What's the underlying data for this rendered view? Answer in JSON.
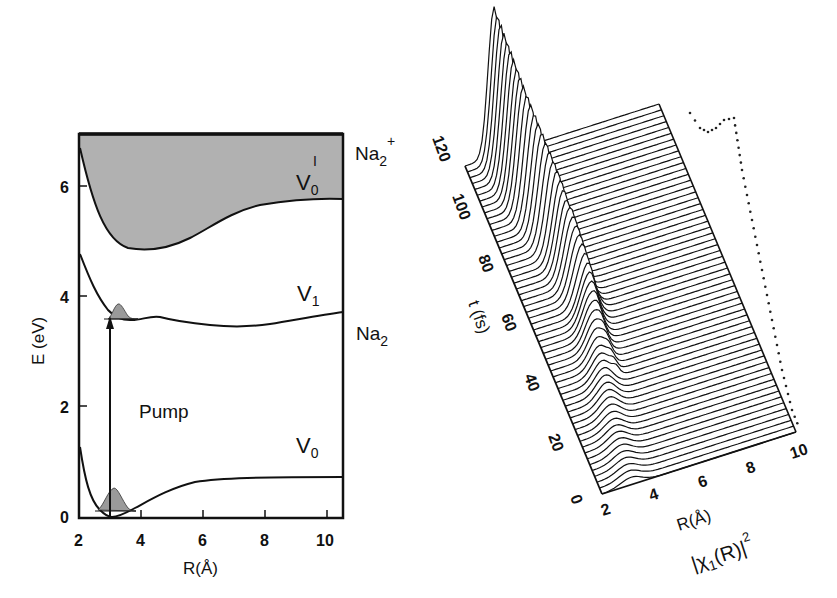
{
  "chart_data": [
    {
      "type": "line",
      "title": "",
      "xlabel": "R(Å)",
      "ylabel": "E (eV)",
      "xlim": [
        2,
        10.5
      ],
      "ylim": [
        0,
        7
      ],
      "x_ticks": [
        "2",
        "4",
        "6",
        "8",
        "10"
      ],
      "y_ticks": [
        "0",
        "2",
        "4",
        "6"
      ],
      "grid": false,
      "series": [
        {
          "name": "V0",
          "label": "V₀",
          "molecule": "Na2",
          "x": [
            2.0,
            2.3,
            2.6,
            3.0,
            3.3,
            3.6,
            4.0,
            5.0,
            6.0,
            7.0,
            8.0,
            10.5
          ],
          "y": [
            1.4,
            0.6,
            0.15,
            0.0,
            0.03,
            0.12,
            0.3,
            0.58,
            0.68,
            0.71,
            0.72,
            0.72
          ]
        },
        {
          "name": "V1",
          "label": "V₁",
          "molecule": "Na2",
          "x": [
            2.0,
            2.3,
            2.6,
            3.0,
            3.4,
            3.8,
            4.6,
            5.5,
            6.5,
            7.5,
            8.5,
            10.5
          ],
          "y": [
            4.9,
            4.3,
            3.9,
            3.65,
            3.58,
            3.56,
            3.63,
            3.5,
            3.45,
            3.46,
            3.55,
            3.72
          ]
        },
        {
          "name": "V0'",
          "label": "V₀'",
          "molecule": "Na2+",
          "shaded": true,
          "x": [
            2.0,
            2.3,
            2.7,
            3.2,
            3.8,
            4.5,
            5.5,
            6.5,
            7.5,
            8.5,
            10.5
          ],
          "y": [
            6.7,
            6.0,
            5.4,
            5.0,
            4.88,
            5.0,
            5.35,
            5.6,
            5.73,
            5.77,
            5.78
          ]
        }
      ],
      "annotations": [
        {
          "text": "Pump",
          "type": "vertical arrow",
          "x": 3.0,
          "from_y": 0.0,
          "to_y": 3.65
        },
        {
          "text": "Na₂⁺",
          "at": "right of V0' curve"
        },
        {
          "text": "Na₂",
          "at": "right of V1 curve"
        },
        {
          "text": "ground-state wavepacket",
          "x_center": 3.1,
          "on": "V0"
        },
        {
          "text": "excited wavepacket",
          "x_center": 3.2,
          "on": "V1"
        }
      ]
    },
    {
      "type": "area",
      "subtype": "3d waterfall",
      "title": "",
      "xlabel": "R(Å)",
      "ylabel": "t (fs)",
      "zlabel": "|χ₁(R)|²",
      "xlim": [
        2,
        10
      ],
      "ylim": [
        0,
        120
      ],
      "x_ticks": [
        "2",
        "4",
        "6",
        "8",
        "10"
      ],
      "y_ticks": [
        "0",
        "20",
        "40",
        "60",
        "80",
        "100",
        "120"
      ],
      "grid": false,
      "description": "Wavepacket probability density on V1 vs R and t; peak near R≈3.2 Å at t=0 grows and moves, reaching maximum amplitude near t≈120 fs at small R; dotted curve shows projection at final time",
      "series": [
        {
          "name": "peak_R_vs_t",
          "t": [
            0,
            20,
            40,
            60,
            80,
            100,
            120
          ],
          "R": [
            3.2,
            3.4,
            3.8,
            4.2,
            4.0,
            3.5,
            3.2
          ],
          "relative_amplitude": [
            0.05,
            0.08,
            0.15,
            0.3,
            0.55,
            0.8,
            1.0
          ]
        }
      ]
    }
  ],
  "left_plot": {
    "ylabel": "E (eV)",
    "xlabel": "R(Å)",
    "y_ticks": [
      "0",
      "2",
      "4",
      "6"
    ],
    "x_ticks": [
      "2",
      "4",
      "6",
      "8",
      "10"
    ],
    "labels": {
      "v0_prime": "V",
      "v0_prime_sub": "0",
      "v0_prime_sup": "I",
      "v1": "V",
      "v1_sub": "1",
      "v0": "V",
      "v0_sub": "0",
      "na2_plus": "Na",
      "na2_plus_sub": "2",
      "na2_plus_sup": "+",
      "na2": "Na",
      "na2_sub": "2",
      "pump": "Pump"
    }
  },
  "right_plot": {
    "t_label": "t (fs)",
    "t_ticks": [
      "0",
      "20",
      "40",
      "60",
      "80",
      "100",
      "120"
    ],
    "r_ticks": [
      "2",
      "4",
      "6",
      "8",
      "10"
    ],
    "r_label": "R(Å)",
    "z_label": "|χ",
    "z_label_sub": "1",
    "z_label_mid": "(R)|",
    "z_label_sup": "2"
  },
  "colors": {
    "ink": "#111111",
    "shade": "#a9a9a9",
    "background": "#ffffff"
  }
}
